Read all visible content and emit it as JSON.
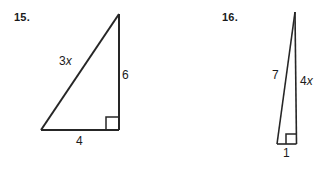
{
  "page": {
    "background_color": "#ffffff",
    "ink_color": "#262626"
  },
  "problems": [
    {
      "number": "15.",
      "figure": "right-triangle",
      "orientation": "right angle at bottom-right, apex at top-right",
      "labels": {
        "hypotenuse": {
          "coefficient": "3",
          "variable": "x"
        },
        "vertical_leg": "6",
        "horizontal_leg": "4"
      },
      "right_angle_marked": true
    },
    {
      "number": "16.",
      "figure": "right-triangle",
      "orientation": "right angle at bottom-right, apex at top, very narrow",
      "labels": {
        "hypotenuse": "7",
        "vertical_leg": {
          "coefficient": "4",
          "variable": "x"
        },
        "horizontal_leg": "1"
      },
      "right_angle_marked": true
    }
  ]
}
